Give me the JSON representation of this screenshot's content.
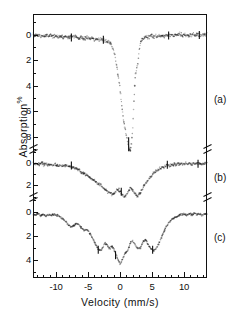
{
  "figure": {
    "background": "#ffffff",
    "ink_color": "#111111"
  },
  "axes": {
    "x_title": "Velocity  (mm/s)",
    "y_title_text": "Absorption",
    "y_title_unit": "%",
    "x_major_labels": [
      "-10",
      "-5",
      "0",
      "5",
      "10"
    ],
    "x_major_values": [
      -10,
      -5,
      0,
      5,
      10
    ],
    "x_min": -13.6,
    "x_max": 13.6,
    "x_minor_step": 1
  },
  "panels": [
    {
      "tag": "(a)",
      "y_labels": [
        "0",
        "2",
        "4",
        "6",
        "8"
      ],
      "y_values": [
        0,
        2,
        4,
        6,
        8
      ],
      "y_min": -1.0,
      "y_max": 9.2
    },
    {
      "tag": "(b)",
      "y_labels": [
        "0",
        "2"
      ],
      "y_values": [
        0,
        2
      ],
      "y_min": -1.0,
      "y_max": 3.3
    },
    {
      "tag": "(c)",
      "y_labels": [
        "0",
        "2",
        "4"
      ],
      "y_values": [
        0,
        2,
        4
      ],
      "y_min": -1.0,
      "y_max": 5.0
    }
  ],
  "chart_data": {
    "type": "scatter",
    "title": "",
    "xlabel": "Velocity  (mm/s)",
    "ylabel": "Absorption %",
    "xlim": [
      -13.6,
      13.6
    ],
    "grid": false,
    "legend": "none",
    "note": "Three stacked Mossbauer absorption spectra (a), (b), (c) sharing one velocity axis; each panel has its own broken Absorption % scale. Values below are absorption in percent versus velocity in mm/s.",
    "series": [
      {
        "name": "(a)",
        "panel": "a",
        "ylim": [
          -1.0,
          9.2
        ],
        "marker": "dot",
        "scatter_percent": 0.18,
        "x": [
          -13.2,
          -12.8,
          -12.4,
          -12.0,
          -11.6,
          -11.2,
          -10.8,
          -10.4,
          -10.0,
          -9.6,
          -9.2,
          -8.8,
          -8.4,
          -8.0,
          -7.6,
          -7.2,
          -6.8,
          -6.4,
          -6.0,
          -5.6,
          -5.2,
          -4.8,
          -4.4,
          -4.0,
          -3.6,
          -3.2,
          -2.8,
          -2.4,
          -2.0,
          -1.6,
          -1.2,
          -0.8,
          -0.4,
          0.0,
          0.2,
          0.4,
          0.6,
          0.8,
          1.0,
          1.2,
          1.4,
          1.6,
          1.8,
          2.0,
          2.2,
          2.4,
          2.6,
          2.8,
          3.0,
          3.2,
          3.6,
          4.0,
          4.4,
          4.8,
          5.2,
          5.6,
          6.0,
          6.4,
          6.8,
          7.2,
          7.6,
          8.0,
          8.4,
          8.8,
          9.2,
          9.6,
          10.0,
          10.4,
          10.8,
          11.2,
          11.6,
          12.0,
          12.4,
          12.8,
          13.2
        ],
        "y": [
          0.02,
          0.05,
          0.0,
          0.08,
          0.03,
          0.1,
          0.05,
          0.12,
          0.08,
          0.15,
          0.1,
          0.18,
          0.12,
          0.2,
          0.15,
          0.22,
          0.18,
          0.25,
          0.2,
          0.3,
          0.25,
          0.32,
          0.28,
          0.35,
          0.3,
          0.38,
          0.35,
          0.45,
          0.5,
          0.65,
          0.9,
          1.6,
          2.8,
          4.2,
          5.2,
          6.1,
          6.8,
          7.4,
          7.9,
          8.4,
          8.8,
          9.0,
          8.6,
          7.2,
          5.0,
          3.2,
          2.6,
          2.3,
          1.2,
          0.55,
          0.3,
          0.2,
          0.15,
          0.1,
          0.12,
          0.08,
          0.1,
          0.05,
          0.08,
          0.02,
          0.05,
          0.0,
          0.04,
          0.0,
          0.03,
          0.0,
          0.02,
          0.0,
          0.05,
          0.0,
          0.03,
          0.0,
          0.02,
          0.05,
          0.0
        ]
      },
      {
        "name": "(b)",
        "panel": "b",
        "ylim": [
          -1.0,
          3.3
        ],
        "marker": "dot",
        "scatter_percent": 0.16,
        "x": [
          -13.2,
          -12.8,
          -12.4,
          -12.0,
          -11.6,
          -11.2,
          -10.8,
          -10.4,
          -10.0,
          -9.6,
          -9.2,
          -8.8,
          -8.4,
          -8.0,
          -7.6,
          -7.2,
          -6.8,
          -6.4,
          -6.0,
          -5.6,
          -5.2,
          -4.8,
          -4.4,
          -4.0,
          -3.6,
          -3.2,
          -2.8,
          -2.4,
          -2.0,
          -1.6,
          -1.2,
          -0.8,
          -0.4,
          0.0,
          0.4,
          0.8,
          1.2,
          1.6,
          2.0,
          2.4,
          2.8,
          3.2,
          3.6,
          4.0,
          4.4,
          4.8,
          5.2,
          5.6,
          6.0,
          6.4,
          6.8,
          7.2,
          7.6,
          8.0,
          8.4,
          8.8,
          9.2,
          9.6,
          10.0,
          10.4,
          10.8,
          11.2,
          11.6,
          12.0,
          12.4,
          12.8,
          13.2
        ],
        "y": [
          0.05,
          0.1,
          0.02,
          0.12,
          0.08,
          0.15,
          0.1,
          0.18,
          0.15,
          0.22,
          0.18,
          0.25,
          0.22,
          0.3,
          0.28,
          0.4,
          0.5,
          0.62,
          0.78,
          0.95,
          1.1,
          1.25,
          1.4,
          1.55,
          1.72,
          1.9,
          2.1,
          2.3,
          2.5,
          2.65,
          2.8,
          2.6,
          2.35,
          2.5,
          2.9,
          3.0,
          2.7,
          2.2,
          2.45,
          2.8,
          2.95,
          2.6,
          2.2,
          1.85,
          1.5,
          1.2,
          0.95,
          0.72,
          0.55,
          0.42,
          0.32,
          0.25,
          0.2,
          0.15,
          0.12,
          0.1,
          0.08,
          0.1,
          0.05,
          0.08,
          0.02,
          0.06,
          0.0,
          0.05,
          0.02,
          0.08,
          0.03
        ]
      },
      {
        "name": "(c)",
        "panel": "c",
        "ylim": [
          -1.0,
          5.0
        ],
        "marker": "dot",
        "scatter_percent": 0.1,
        "x": [
          -13.2,
          -12.8,
          -12.4,
          -12.0,
          -11.6,
          -11.2,
          -10.8,
          -10.4,
          -10.0,
          -9.6,
          -9.2,
          -8.8,
          -8.4,
          -8.0,
          -7.6,
          -7.2,
          -6.8,
          -6.4,
          -6.0,
          -5.6,
          -5.2,
          -4.8,
          -4.4,
          -4.0,
          -3.6,
          -3.2,
          -2.8,
          -2.4,
          -2.0,
          -1.6,
          -1.2,
          -0.8,
          -0.4,
          0.0,
          0.4,
          0.8,
          1.2,
          1.6,
          2.0,
          2.4,
          2.8,
          3.2,
          3.6,
          4.0,
          4.4,
          4.8,
          5.2,
          5.6,
          6.0,
          6.4,
          6.8,
          7.2,
          7.6,
          8.0,
          8.4,
          8.8,
          9.2,
          9.6,
          10.0,
          10.4,
          10.8,
          11.2,
          11.6,
          12.0,
          12.4,
          12.8,
          13.2
        ],
        "y": [
          0.25,
          0.15,
          0.3,
          0.18,
          0.35,
          0.22,
          0.3,
          0.2,
          0.28,
          0.35,
          0.45,
          0.6,
          0.85,
          1.1,
          1.25,
          1.15,
          0.95,
          1.05,
          1.3,
          1.55,
          1.45,
          1.7,
          2.1,
          2.5,
          2.9,
          3.2,
          3.1,
          2.6,
          2.75,
          3.05,
          2.85,
          3.3,
          3.9,
          4.35,
          3.95,
          3.4,
          3.25,
          2.6,
          2.4,
          2.75,
          3.05,
          2.95,
          2.5,
          2.3,
          2.7,
          3.05,
          3.2,
          3.1,
          2.7,
          2.2,
          1.7,
          1.25,
          0.9,
          0.65,
          0.5,
          0.4,
          0.3,
          0.22,
          0.18,
          0.25,
          0.15,
          0.22,
          0.1,
          0.2,
          0.12,
          0.28,
          0.15
        ]
      }
    ]
  }
}
